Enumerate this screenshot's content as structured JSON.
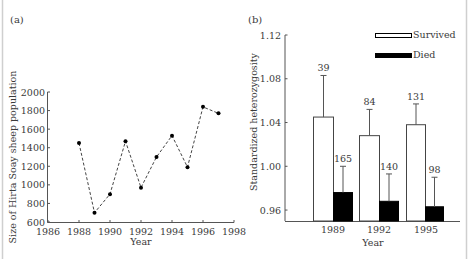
{
  "panels": {
    "a": {
      "label": "(a)"
    },
    "b": {
      "label": "(b)"
    }
  },
  "chart_data": [
    {
      "type": "line",
      "panel": "(a)",
      "title": "",
      "xlabel": "Year",
      "ylabel": "Size of Hirta Soay sheep population",
      "xlim": [
        1986,
        1998
      ],
      "ylim": [
        600,
        2000
      ],
      "xticks": [
        1986,
        1988,
        1990,
        1992,
        1994,
        1996,
        1998
      ],
      "yticks": [
        600,
        800,
        1000,
        1200,
        1400,
        1600,
        1800,
        2000
      ],
      "line_style": "dashed",
      "marker": "filled-circle",
      "grid": false,
      "x": [
        1988,
        1989,
        1990,
        1991,
        1992,
        1993,
        1994,
        1995,
        1996,
        1997
      ],
      "y": [
        1450,
        700,
        900,
        1470,
        970,
        1300,
        1530,
        1190,
        1840,
        1770
      ]
    },
    {
      "type": "bar",
      "panel": "(b)",
      "title": "",
      "xlabel": "Year",
      "ylabel": "Standardized heterozygosity",
      "ylim": [
        0.95,
        1.12
      ],
      "yticks": [
        0.96,
        1.0,
        1.04,
        1.08,
        1.12
      ],
      "ytick_labels": [
        "0.96",
        "1.00",
        "1.04",
        "1.08",
        "1.12"
      ],
      "categories": [
        "1989",
        "1992",
        "1995"
      ],
      "legend_position": "top-right",
      "grid": false,
      "series": [
        {
          "name": "Survived",
          "color": "#ffffff",
          "values": [
            1.045,
            1.028,
            1.038
          ],
          "error_upper": [
            1.083,
            1.052,
            1.057
          ],
          "n_labels": [
            "39",
            "84",
            "131"
          ]
        },
        {
          "name": "Died",
          "color": "#000000",
          "values": [
            0.976,
            0.968,
            0.963
          ],
          "error_upper": [
            1.0,
            0.993,
            0.99
          ],
          "n_labels": [
            "165",
            "140",
            "98"
          ]
        }
      ]
    }
  ]
}
